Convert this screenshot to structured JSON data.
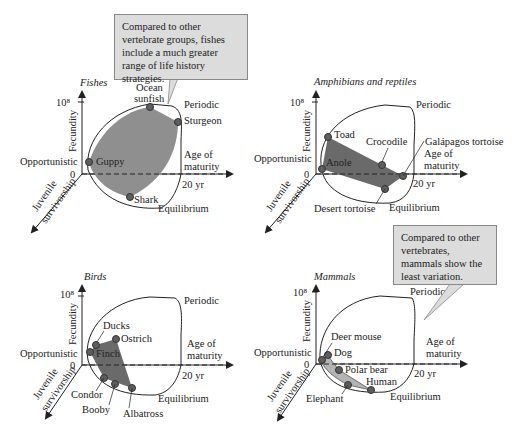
{
  "colors": {
    "envelope": "#222222",
    "fill_fishes": "#8f8f8f",
    "fill_amph": "#6a6a6a",
    "fill_birds": "#6a6a6a",
    "fill_mammals": "#b4b4b4",
    "point": "#5e5e5e",
    "callout_bg": "#dcdcdc"
  },
  "axes_common": {
    "y_axis": "Fecundity",
    "y_max": "10⁸",
    "origin": "0",
    "x_axis_line1": "Age of",
    "x_axis_line2": "maturity",
    "x_tick": "20 yr",
    "z_axis_line1": "Juvenile",
    "z_axis_line2": "survivorship",
    "corner_opportunistic": "Opportunistic",
    "corner_periodic": "Periodic",
    "corner_equilibrium": "Equilibrium"
  },
  "panels": {
    "fishes": {
      "title": "Fishes",
      "points": [
        "Ocean",
        "sunfish",
        "Sturgeon",
        "Guppy",
        "Shark"
      ]
    },
    "amphibians": {
      "title": "Amphibians and reptiles",
      "points": [
        "Toad",
        "Crocodile",
        "Galápagos tortoise",
        "Anole",
        "Desert tortoise"
      ]
    },
    "birds": {
      "title": "Birds",
      "points": [
        "Ducks",
        "Ostrich",
        "Finch",
        "Condor",
        "Booby",
        "Albatross"
      ]
    },
    "mammals": {
      "title": "Mammals",
      "points": [
        "Deer mouse",
        "Dog",
        "Polar bear",
        "Human",
        "Elephant"
      ]
    }
  },
  "callouts": {
    "fishes": "Compared to other vertebrate groups, fishes include a much greater range of life history strategies.",
    "mammals": "Compared to other vertebrates, mammals show the least variation."
  }
}
